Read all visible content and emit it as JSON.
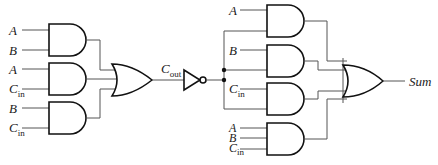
{
  "diagram": {
    "left_inputs": [
      {
        "var": "A",
        "sub": ""
      },
      {
        "var": "B",
        "sub": ""
      },
      {
        "var": "A",
        "sub": ""
      },
      {
        "var": "C",
        "sub": "in"
      },
      {
        "var": "B",
        "sub": ""
      },
      {
        "var": "C",
        "sub": "in"
      }
    ],
    "carry_label": {
      "var": "C",
      "sub": "out"
    },
    "right_inputs": [
      {
        "var": "A",
        "sub": ""
      },
      {
        "var": "B",
        "sub": ""
      },
      {
        "var": "C",
        "sub": "in"
      },
      {
        "var": "A",
        "sub": ""
      },
      {
        "var": "B",
        "sub": ""
      },
      {
        "var": "C",
        "sub": "in"
      }
    ],
    "output_label": "Sum",
    "gates": [
      "AND",
      "AND",
      "AND",
      "OR",
      "NOT",
      "AND",
      "AND",
      "AND",
      "AND",
      "OR"
    ]
  }
}
